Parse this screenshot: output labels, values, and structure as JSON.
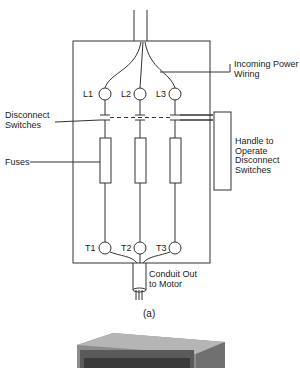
{
  "figure": {
    "caption": "(a)",
    "labels": {
      "incoming_power": "Incoming Power\nWiring",
      "disconnect_switches": "Disconnect\nSwitches",
      "fuses": "Fuses",
      "handle": "Handle to\nOperate\nDisconnect\nSwitches",
      "conduit": "Conduit Out\nto Motor"
    },
    "line_terminals": [
      "L1",
      "L2",
      "L3"
    ],
    "load_terminals": [
      "T1",
      "T2",
      "T3"
    ]
  },
  "colors": {
    "line": "#333333",
    "device_dark": "#4a4a4a",
    "device_light": "#9a9a9a"
  }
}
